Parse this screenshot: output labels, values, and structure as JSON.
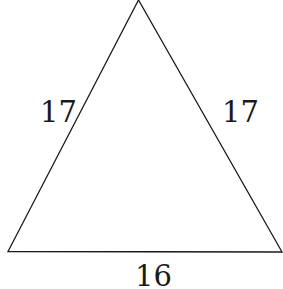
{
  "diagram": {
    "shape": "isosceles triangle",
    "sides": {
      "left": "17",
      "right": "17",
      "base": "16"
    },
    "stroke_color": "#1a1a1a"
  }
}
